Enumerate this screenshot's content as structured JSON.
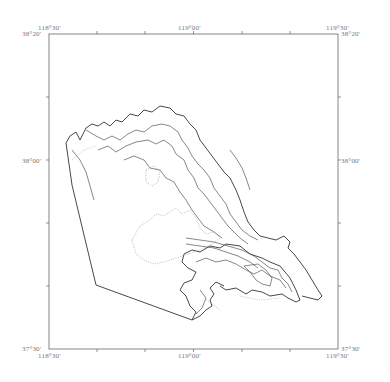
{
  "map": {
    "type": "geographic-map",
    "frame": {
      "left_lon": "118°30′",
      "right_lon": "119°30′",
      "top_lat": "38°20′",
      "bottom_lat": "37°30′",
      "stroke_color": "#555555"
    },
    "top_labels": {
      "left": "118°30′",
      "center": "119°00′",
      "right": "119°30′"
    },
    "bottom_labels": {
      "left": "118°30′",
      "center": "119°00′",
      "right": "119°30′"
    },
    "left_labels": {
      "top": "38°20′",
      "middle": "38°00′",
      "bottom": "37°30′"
    },
    "right_labels": {
      "top": "38°20′",
      "middle": "38°00′",
      "bottom": "37°30′"
    },
    "colors": {
      "outline": "#333333",
      "contour": "#555555",
      "dotted": "#aaaaaa",
      "label": "#777777"
    }
  }
}
